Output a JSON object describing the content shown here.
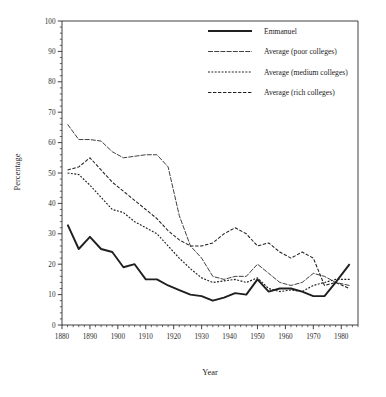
{
  "chart_data": {
    "type": "line",
    "title": "",
    "xlabel": "Year",
    "ylabel": "Percentage",
    "xlim": [
      1880,
      1986
    ],
    "ylim": [
      0,
      100
    ],
    "grid": false,
    "legend_position": "top-right",
    "xticks": [
      1880,
      1890,
      1900,
      1910,
      1920,
      1930,
      1940,
      1950,
      1960,
      1970,
      1980
    ],
    "xtick_labels": [
      "1880",
      "1890",
      "1900",
      "1910",
      "1920",
      "1930",
      "1940",
      "1950",
      "1960",
      "1970",
      "1980"
    ],
    "xminor_step": 2,
    "yticks": [
      0,
      10,
      20,
      30,
      40,
      50,
      60,
      70,
      80,
      90,
      100
    ],
    "ytick_labels": [
      "0",
      "10",
      "20",
      "30",
      "40",
      "50",
      "60",
      "70",
      "80",
      "90",
      "100"
    ],
    "yminor_step": 2,
    "series": [
      {
        "name": "Emmanuel",
        "style": "solid",
        "linewidth": 1.9,
        "x": [
          1882,
          1886,
          1890,
          1894,
          1898,
          1902,
          1906,
          1910,
          1914,
          1918,
          1922,
          1926,
          1930,
          1934,
          1938,
          1942,
          1946,
          1950,
          1954,
          1958,
          1962,
          1966,
          1970,
          1974,
          1978,
          1983
        ],
        "y": [
          33,
          25,
          29,
          25,
          24,
          19,
          20,
          15,
          15,
          13,
          11.5,
          10,
          9.5,
          8,
          9,
          10.5,
          10,
          15,
          11,
          12,
          12,
          11,
          9.5,
          9.5,
          14,
          20
        ]
      },
      {
        "name": "Average (poor colleges)",
        "style": "long-dash",
        "linewidth": 0.85,
        "x": [
          1882,
          1886,
          1890,
          1894,
          1898,
          1902,
          1906,
          1910,
          1914,
          1918,
          1922,
          1926,
          1930,
          1934,
          1938,
          1942,
          1946,
          1950,
          1954,
          1958,
          1962,
          1966,
          1970,
          1974,
          1978,
          1983
        ],
        "y": [
          66,
          61,
          61,
          60.5,
          57,
          55,
          55.5,
          56,
          56,
          52,
          36,
          26,
          22,
          16,
          15,
          16,
          16,
          20,
          17,
          14,
          13,
          14,
          17,
          16,
          14,
          13
        ]
      },
      {
        "name": "Average (medium colleges)",
        "style": "dotted",
        "linewidth": 1.15,
        "x": [
          1882,
          1886,
          1890,
          1894,
          1898,
          1902,
          1906,
          1910,
          1914,
          1918,
          1922,
          1926,
          1930,
          1934,
          1938,
          1942,
          1946,
          1950,
          1954,
          1958,
          1962,
          1966,
          1970,
          1974,
          1978,
          1983
        ],
        "y": [
          50,
          49.5,
          46,
          42,
          38,
          37,
          34,
          32,
          30,
          26,
          22,
          18.5,
          15.5,
          14,
          14.5,
          15,
          14,
          15.5,
          12,
          11,
          11.5,
          11,
          13,
          14,
          15,
          15
        ]
      },
      {
        "name": "Average (rich colleges)",
        "style": "dash",
        "linewidth": 1.05,
        "x": [
          1882,
          1886,
          1890,
          1894,
          1898,
          1902,
          1906,
          1910,
          1914,
          1918,
          1922,
          1926,
          1930,
          1934,
          1938,
          1942,
          1946,
          1950,
          1954,
          1958,
          1962,
          1966,
          1970,
          1974,
          1978,
          1983
        ],
        "y": [
          51,
          52,
          55,
          51,
          47,
          44,
          41,
          38,
          35,
          31,
          28,
          26,
          26,
          27,
          30,
          32,
          30,
          26,
          27,
          24,
          22,
          24,
          22,
          13,
          14,
          12
        ]
      }
    ]
  },
  "legend": {
    "entries": [
      {
        "label": "Emmanuel",
        "style": "solid"
      },
      {
        "label": "Average (poor colleges)",
        "style": "long-dash"
      },
      {
        "label": "Average (medium colleges)",
        "style": "dotted"
      },
      {
        "label": "Average (rich colleges)",
        "style": "dash"
      }
    ]
  },
  "axes": {
    "x_title": "Year",
    "y_title": "Percentage"
  }
}
